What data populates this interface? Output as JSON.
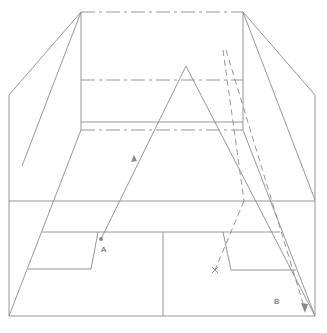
{
  "diagram": {
    "type": "perspective-room-light-path",
    "stroke_color": "#8a8a8a",
    "point_color": "#888888",
    "labels": {
      "a": "A",
      "b": "B"
    },
    "points": {
      "A": {
        "x": 101,
        "y": 239
      },
      "B_label": {
        "x": 276,
        "y": 302
      }
    }
  }
}
